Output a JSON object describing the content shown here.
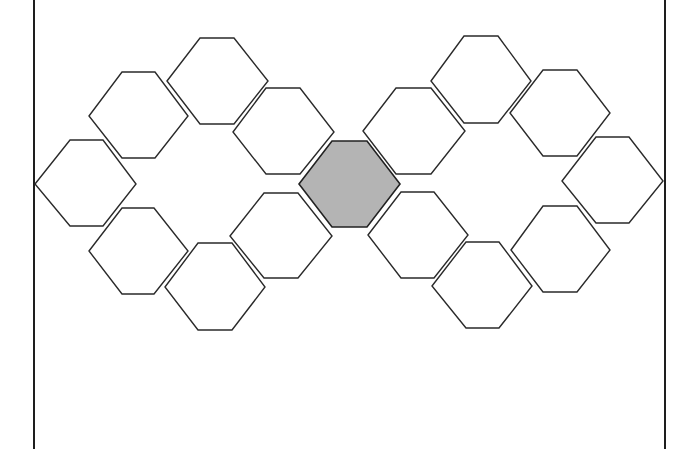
{
  "diagram": {
    "type": "hexagon-arrangement",
    "frame": {
      "left_x": 34,
      "right_x": 665,
      "top_y": 0,
      "bottom_y": 449,
      "color": "#1e1e1e"
    },
    "colors": {
      "outline": "#2a2a2a",
      "empty_fill": "#ffffff",
      "center_fill": "#b4b4b4"
    },
    "center_hexagon": {
      "id": "center",
      "points": "299,184 332,141 367,141 400,184 367,227 332,227",
      "filled": true
    },
    "hexagons": [
      {
        "id": "left-1",
        "points": "35,184 70,140 103,140 136,184 103,226 70,226"
      },
      {
        "id": "left-2",
        "points": "89,116 122,72 155,72 188,116 155,158 122,158"
      },
      {
        "id": "left-3",
        "points": "167,81 200,38 234,38 268,81 234,124 200,124"
      },
      {
        "id": "left-4",
        "points": "233,132 266,88 300,88 334,132 300,174 266,174"
      },
      {
        "id": "left-5",
        "points": "89,251 122,208 154,208 188,251 154,294 122,294"
      },
      {
        "id": "left-6",
        "points": "165,287 198,243 232,243 265,287 232,330 198,330"
      },
      {
        "id": "left-7",
        "points": "230,236 264,193 298,193 332,236 298,278 264,278"
      },
      {
        "id": "right-1",
        "points": "363,131 396,88 431,88 465,131 431,174 396,174"
      },
      {
        "id": "right-2",
        "points": "431,81 464,36 498,36 531,81 498,123 464,123"
      },
      {
        "id": "right-3",
        "points": "510,113 543,70 577,70 610,113 577,156 543,156"
      },
      {
        "id": "right-4",
        "points": "562,181 596,137 629,137 663,181 629,223 596,223"
      },
      {
        "id": "right-5",
        "points": "368,235 401,192 434,192 468,235 434,278 401,278"
      },
      {
        "id": "right-6",
        "points": "432,286 466,242 499,242 532,286 499,328 466,328"
      },
      {
        "id": "right-7",
        "points": "511,250 543,206 577,206 610,250 577,292 543,292"
      }
    ]
  }
}
